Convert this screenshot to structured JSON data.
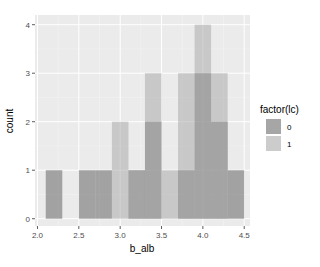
{
  "chart_data": {
    "type": "histogram",
    "title": "",
    "xlabel": "b_alb",
    "ylabel": "count",
    "xlim": [
      1.97,
      4.57
    ],
    "ylim": [
      -0.15,
      4.2
    ],
    "x_ticks": [
      2.0,
      2.5,
      3.0,
      3.5,
      4.0,
      4.5
    ],
    "x_tick_labels": [
      "2.0",
      "2.5",
      "3.0",
      "3.5",
      "4.0",
      "4.5"
    ],
    "y_ticks": [
      0,
      1,
      2,
      3,
      4
    ],
    "y_tick_labels": [
      "0",
      "1",
      "2",
      "3",
      "4"
    ],
    "grid": true,
    "bin_width": 0.2,
    "bin_edges": [
      2.1,
      2.3,
      2.5,
      2.7,
      2.9,
      3.1,
      3.3,
      3.5,
      3.7,
      3.9,
      4.1,
      4.3,
      4.5
    ],
    "legend": {
      "title": "factor(lc)",
      "position": "right",
      "entries": [
        "0",
        "1"
      ]
    },
    "series": [
      {
        "name": "0",
        "color": "#595959",
        "values": [
          1,
          0,
          1,
          1,
          0,
          1,
          2,
          0,
          1,
          3,
          2,
          1
        ]
      },
      {
        "name": "1",
        "color": "#a6a6a6",
        "values": [
          0,
          0,
          0,
          0,
          2,
          1,
          3,
          1,
          3,
          4,
          3,
          0
        ]
      }
    ]
  }
}
